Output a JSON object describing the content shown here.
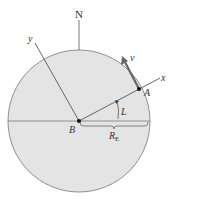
{
  "diagram": {
    "labels": {
      "north": "N",
      "y_axis": "y",
      "x_axis": "x",
      "velocity": "v",
      "point_a": "A",
      "point_b": "B",
      "latitude": "L",
      "radius": "R",
      "radius_sub": "E"
    },
    "colors": {
      "earth_fill": "#e4e4e4",
      "line": "#555555",
      "velocity_arrow": "#666666",
      "point": "#111111"
    }
  }
}
